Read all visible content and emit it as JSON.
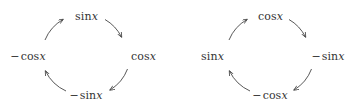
{
  "figure": {
    "background_color": "#ffffff",
    "stroke_color": "#3a3a3a",
    "text_color": "#333333",
    "width": 362,
    "height": 110
  },
  "diagrams": [
    {
      "name": "sine-derivative-cycle",
      "center_x": 86,
      "center_y": 55,
      "radius": 42,
      "direction": "clockwise",
      "nodes": [
        {
          "position": "top",
          "text": "sin x",
          "sign": "",
          "fn": "sin",
          "var": "x",
          "x": 86,
          "y": 16
        },
        {
          "position": "right",
          "text": "cos x",
          "sign": "",
          "fn": "cos",
          "var": "x",
          "x": 143,
          "y": 56
        },
        {
          "position": "bottom",
          "text": "- sin x",
          "sign": "−",
          "fn": "sin",
          "var": "x",
          "x": 86,
          "y": 95
        },
        {
          "position": "left",
          "text": "- cos x",
          "sign": "−",
          "fn": "cos",
          "var": "x",
          "x": 28,
          "y": 56
        }
      ],
      "arrows": [
        {
          "from": "top",
          "to": "right",
          "name": "arrow-sinx-to-cosx"
        },
        {
          "from": "right",
          "to": "bottom",
          "name": "arrow-cosx-to-negsinx"
        },
        {
          "from": "bottom",
          "to": "left",
          "name": "arrow-negsinx-to-negcosx"
        },
        {
          "from": "left",
          "to": "top",
          "name": "arrow-negcosx-to-sinx"
        }
      ]
    },
    {
      "name": "cosine-derivative-cycle",
      "center_x": 270,
      "center_y": 55,
      "radius": 42,
      "direction": "clockwise",
      "nodes": [
        {
          "position": "top",
          "text": "cos x",
          "sign": "",
          "fn": "cos",
          "var": "x",
          "x": 270,
          "y": 16
        },
        {
          "position": "right",
          "text": "- sin x",
          "sign": "−",
          "fn": "sin",
          "var": "x",
          "x": 328,
          "y": 56
        },
        {
          "position": "bottom",
          "text": "- cos x",
          "sign": "−",
          "fn": "cos",
          "var": "x",
          "x": 270,
          "y": 95
        },
        {
          "position": "left",
          "text": "sin x",
          "sign": "",
          "fn": "sin",
          "var": "x",
          "x": 212,
          "y": 56
        }
      ],
      "arrows": [
        {
          "from": "top",
          "to": "right",
          "name": "arrow-cosx-to-negsinx"
        },
        {
          "from": "right",
          "to": "bottom",
          "name": "arrow-negsinx-to-negcosx"
        },
        {
          "from": "bottom",
          "to": "left",
          "name": "arrow-negcosx-to-sinx"
        },
        {
          "from": "left",
          "to": "top",
          "name": "arrow-sinx-to-cosx"
        }
      ]
    }
  ]
}
